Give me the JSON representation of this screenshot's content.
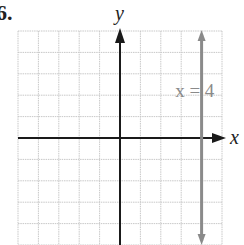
{
  "problem": {
    "number_label": "6."
  },
  "chart_data": {
    "type": "line",
    "title": "",
    "xlabel": "x",
    "ylabel": "y",
    "xlim": [
      -5,
      5
    ],
    "ylim": [
      -5,
      5
    ],
    "grid": true,
    "grid_step": 1,
    "tick_labels": false,
    "series": [
      {
        "name": "x = 4",
        "kind": "vertical-line",
        "x": 4,
        "points": [
          [
            4,
            -5
          ],
          [
            4,
            5
          ]
        ],
        "arrows": "both",
        "color": "#8a8a8a"
      }
    ],
    "annotations": [
      {
        "text": "x = 4",
        "x": 2.9,
        "y": 2.1,
        "color": "#8a8a8a"
      }
    ]
  },
  "colors": {
    "grid": "#c8c8c8",
    "axis": "#1a1a1a",
    "graph_line": "#8a8a8a",
    "label": "#222222"
  },
  "labels": {
    "x_axis": "x",
    "y_axis": "y",
    "line_label": "x = 4"
  }
}
